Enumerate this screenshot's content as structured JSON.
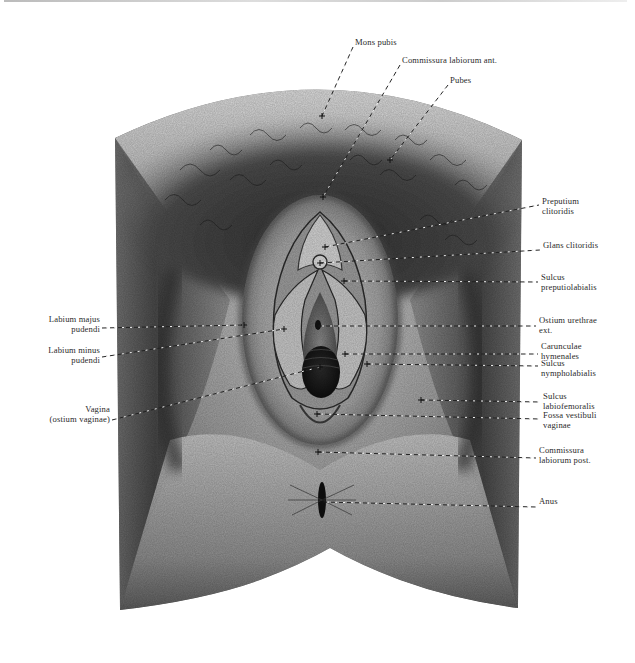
{
  "figure": {
    "colors": {
      "background": "#ffffff",
      "ink": "#2a2a2a",
      "skin_light": "#d6d6d6",
      "skin_dark": "#3a3a3a"
    }
  },
  "labels": {
    "top": [
      {
        "id": "mons-pubis",
        "lines": [
          "Mons pubis"
        ],
        "x": 355,
        "y": 44,
        "target": [
          322,
          116
        ]
      },
      {
        "id": "commissura-labiorum-ant",
        "lines": [
          "Commissura labiorum ant."
        ],
        "x": 402,
        "y": 62,
        "target": [
          323,
          197
        ]
      },
      {
        "id": "pubes",
        "lines": [
          "Pubes"
        ],
        "x": 450,
        "y": 82,
        "target": [
          390,
          160
        ]
      }
    ],
    "right": [
      {
        "id": "preputium-clitoridis",
        "lines": [
          "Preputium",
          "clitoridis"
        ],
        "x": 542,
        "y": 202,
        "line_y": 205,
        "target": [
          325,
          247
        ]
      },
      {
        "id": "glans-clitoridis",
        "lines": [
          "Glans clitoridis"
        ],
        "x": 543,
        "y": 246,
        "line_y": 250,
        "target": [
          320,
          263
        ]
      },
      {
        "id": "sulcus-preputiolabialis",
        "lines": [
          "Sulcus",
          "preputiolabialis"
        ],
        "x": 541,
        "y": 278,
        "line_y": 282,
        "target": [
          344,
          281
        ]
      },
      {
        "id": "ostium-urethrae-ext",
        "lines": [
          "Ostium urethrae",
          "ext."
        ],
        "x": 539,
        "y": 321,
        "line_y": 326,
        "target": [
          318,
          326
        ]
      },
      {
        "id": "carunculae-hymenales",
        "lines": [
          "Carunculae",
          "hymenales"
        ],
        "x": 541,
        "y": 347,
        "line_y": 354,
        "target": [
          345,
          354
        ]
      },
      {
        "id": "sulcus-nympholabialis",
        "lines": [
          "Sulcus",
          "nympholabialis"
        ],
        "x": 541,
        "y": 364,
        "line_y": 366,
        "target": [
          367,
          364
        ]
      },
      {
        "id": "sulcus-labiofemoralis",
        "lines": [
          "Sulcus",
          "labiofemoralis"
        ],
        "x": 543,
        "y": 397,
        "line_y": 402,
        "target": [
          421,
          400
        ]
      },
      {
        "id": "fossa-vestibuli-vaginae",
        "lines": [
          "Fossa vestibuli",
          "vaginae"
        ],
        "x": 543,
        "y": 416,
        "line_y": 419,
        "target": [
          317,
          414
        ]
      },
      {
        "id": "commissura-labiorum-post",
        "lines": [
          "Commissura",
          "labiorum post."
        ],
        "x": 539,
        "y": 451,
        "line_y": 458,
        "target": [
          318,
          452
        ]
      },
      {
        "id": "anus",
        "lines": [
          "Anus"
        ],
        "x": 539,
        "y": 502,
        "line_y": 507,
        "target": [
          323,
          502
        ]
      }
    ],
    "left": [
      {
        "id": "labium-majus-pudendi",
        "lines": [
          "Labium majus",
          "pudendi"
        ],
        "right": 535,
        "y": 320,
        "line_y": 328,
        "target": [
          244,
          325
        ]
      },
      {
        "id": "labium-minus-pudendi",
        "lines": [
          "Labium minus",
          "pudendi"
        ],
        "right": 535,
        "y": 351,
        "line_y": 357,
        "target": [
          284,
          329
        ]
      },
      {
        "id": "vagina-ostium-vaginae",
        "lines": [
          "Vagina",
          "(ostium vaginae)"
        ],
        "right": 525,
        "y": 410,
        "line_y": 420,
        "target": [
          320,
          367
        ]
      }
    ]
  }
}
